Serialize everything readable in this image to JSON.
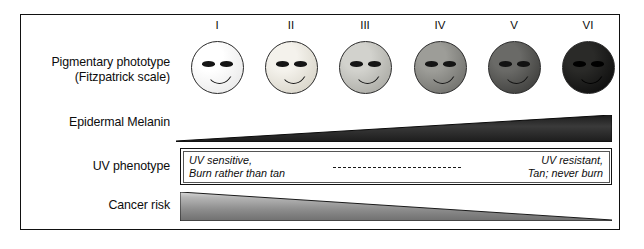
{
  "figure": {
    "frame_color": "#111111",
    "background": "#ffffff"
  },
  "rows": {
    "phototype_label": "Pigmentary phototype\n(Fitzpatrick scale)",
    "melanin_label": "Epidermal Melanin",
    "uv_label": "UV phenotype",
    "cancer_label": "Cancer risk"
  },
  "phototypes": [
    {
      "numeral": "I",
      "skin_light": "#ffffff",
      "skin_dark": "#e8e8e8",
      "cx": 217
    },
    {
      "numeral": "II",
      "skin_light": "#f4f2ec",
      "skin_dark": "#d6d2c6",
      "cx": 291
    },
    {
      "numeral": "III",
      "skin_light": "#d2d2cd",
      "skin_dark": "#a8a8a2",
      "cx": 365
    },
    {
      "numeral": "IV",
      "skin_light": "#9d9d98",
      "skin_dark": "#6e6e6a",
      "cx": 440
    },
    {
      "numeral": "V",
      "skin_light": "#6a6a67",
      "skin_dark": "#3c3c3a",
      "cx": 514
    },
    {
      "numeral": "VI",
      "skin_light": "#2a2a28",
      "skin_dark": "#0c0c0c",
      "cx": 588
    }
  ],
  "melanin_wedge": {
    "direction": "increasing-left-to-right",
    "color_dark": "#1c1c1c",
    "color_mid": "#3a3a3a",
    "x_start": 176,
    "x_end": 612,
    "thin_height": 2,
    "thick_height": 27
  },
  "uv_phenotype": {
    "left_text": "UV sensitive,\nBurn rather than tan",
    "right_text": "UV resistant,\nTan; never burn",
    "connector": "dashed-line"
  },
  "cancer_wedge": {
    "direction": "decreasing-left-to-right",
    "color_light": "#b6b6b6",
    "color_mid": "#8d8d8d",
    "color_dark": "#6f6f6f",
    "x_start": 180,
    "x_end": 612,
    "thick_height": 29,
    "thin_height": 1
  }
}
